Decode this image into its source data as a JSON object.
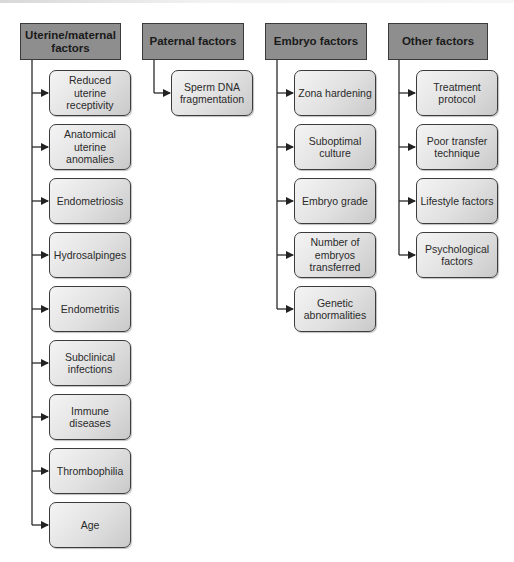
{
  "diagram": {
    "type": "hierarchy",
    "columns": [
      {
        "title": "Uterine/maternal factors",
        "items": [
          "Reduced uterine receptivity",
          "Anatomical uterine anomalies",
          "Endometriosis",
          "Hydrosalpinges",
          "Endometritis",
          "Subclinical infections",
          "Immune diseases",
          "Thrombophilia",
          "Age"
        ]
      },
      {
        "title": "Paternal factors",
        "items": [
          "Sperm DNA fragmentation"
        ]
      },
      {
        "title": "Embryo factors",
        "items": [
          "Zona hardening",
          "Suboptimal culture",
          "Embryo grade",
          "Number of embryos transferred",
          "Genetic abnormalities"
        ]
      },
      {
        "title": "Other factors",
        "items": [
          "Treatment protocol",
          "Poor transfer technique",
          "Lifestyle factors",
          "Psychological factors"
        ]
      }
    ],
    "colors": {
      "header_fill": "#8e8e8e",
      "box_fill_light": "#f4f4f4",
      "box_fill_dark": "#c9c9c9",
      "stroke": "#3c3c3c"
    }
  }
}
